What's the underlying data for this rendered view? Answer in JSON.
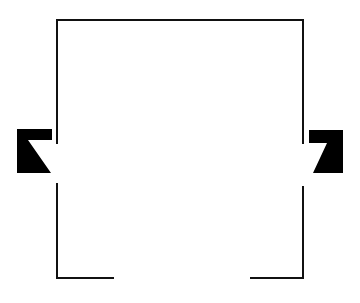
{
  "diagram": {
    "type": "line-drawing",
    "colors": {
      "stroke": "#111111",
      "fill": "#000000",
      "background": "#ffffff"
    },
    "stroke_width": 2,
    "frame": {
      "top": {
        "x1": 57,
        "y1": 20,
        "x2": 303,
        "y2": 20
      },
      "left_upper": {
        "x1": 57,
        "y1": 20,
        "x2": 57,
        "y2": 143
      },
      "left_lower": {
        "x1": 57,
        "y1": 184,
        "x2": 57,
        "y2": 278
      },
      "right_upper": {
        "x1": 303,
        "y1": 20,
        "x2": 303,
        "y2": 143
      },
      "right_lower": {
        "x1": 303,
        "y1": 187,
        "x2": 303,
        "y2": 278
      },
      "bottom_left": {
        "x1": 57,
        "y1": 278,
        "x2": 113,
        "y2": 278
      },
      "bottom_right": {
        "x1": 251,
        "y1": 278,
        "x2": 303,
        "y2": 278
      }
    },
    "shapes": [
      {
        "name": "left-block",
        "points": "17,129 52,129 52,140 28,140 51,173 17,173"
      },
      {
        "name": "right-block",
        "points": "309,130 343,130 343,173 313,173 327,143 309,143"
      }
    ]
  }
}
